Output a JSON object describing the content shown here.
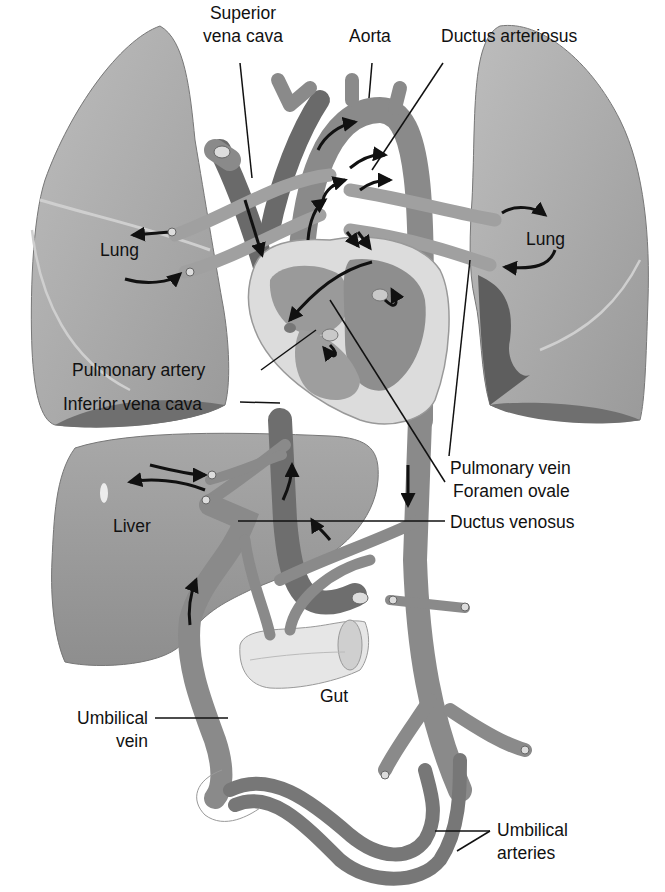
{
  "diagram": {
    "type": "anatomical-illustration",
    "colors": {
      "organ": "#a9a9a9",
      "organ_shadow": "#6f6f6f",
      "vessel": "#8a8a8a",
      "vessel_dark": "#6e6e6e",
      "heart_wall": "#d9d9d9",
      "gut": "#e8e8e8",
      "arrow": "#111111",
      "leader_line": "#111111"
    },
    "labels": {
      "superior_vena_cava_1": "Superior",
      "superior_vena_cava_2": "vena cava",
      "aorta": "Aorta",
      "ductus_arteriosus": "Ductus arteriosus",
      "lung_left": "Lung",
      "lung_right": "Lung",
      "pulmonary_artery": "Pulmonary artery",
      "inferior_vena_cava": "Inferior vena cava",
      "pulmonary_vein": "Pulmonary vein",
      "foramen_ovale": "Foramen ovale",
      "liver": "Liver",
      "ductus_venosus": "Ductus venosus",
      "gut": "Gut",
      "umbilical_vein_1": "Umbilical",
      "umbilical_vein_2": "vein",
      "umbilical_arteries_1": "Umbilical",
      "umbilical_arteries_2": "arteries"
    }
  }
}
